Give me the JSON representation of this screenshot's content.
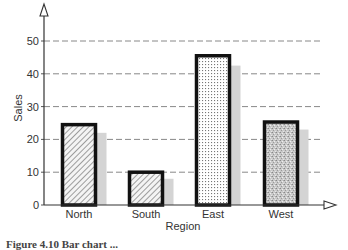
{
  "chart_data": {
    "type": "bar",
    "title": "",
    "xlabel": "Region",
    "ylabel": "Sales",
    "categories": [
      "North",
      "South",
      "East",
      "West"
    ],
    "series": [
      {
        "name": "primary",
        "values": [
          24.5,
          10,
          45.5,
          25.3
        ],
        "fills": [
          "diagonal-hatch",
          "diagonal-hatch",
          "dot-grid",
          "stipple"
        ]
      },
      {
        "name": "shadow",
        "values": [
          22,
          8,
          42.5,
          23
        ],
        "color": "#d4d4d4"
      }
    ],
    "yticks": [
      0,
      10,
      20,
      30,
      40,
      50
    ],
    "ylim": [
      0,
      55
    ],
    "grid": {
      "y": true,
      "style": "dashed"
    },
    "legend": null
  },
  "caption": "Figure 4.10  Bar chart ..."
}
